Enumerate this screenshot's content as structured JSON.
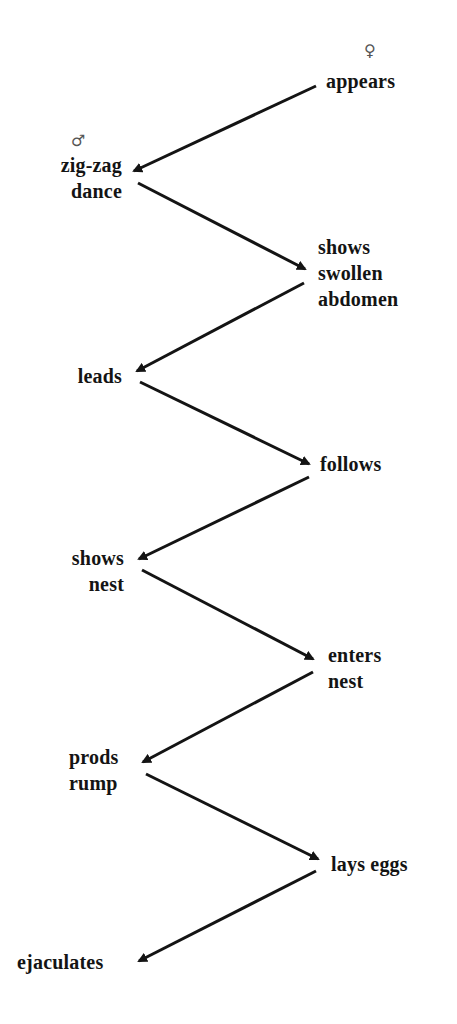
{
  "diagram": {
    "type": "courtship-sequence",
    "colors": {
      "background": "#ffffff",
      "ink": "#141414",
      "symbol": "#555555"
    },
    "symbols": {
      "female": "♀",
      "male": "♂"
    },
    "female_column": [
      {
        "id": "f1",
        "text": "appears"
      },
      {
        "id": "f2",
        "text": "shows\nswollen\nabdomen"
      },
      {
        "id": "f3",
        "text": "follows"
      },
      {
        "id": "f4",
        "text": "enters\nnest"
      },
      {
        "id": "f5",
        "text": "lays eggs"
      }
    ],
    "male_column": [
      {
        "id": "m1",
        "text": "zig-zag\ndance"
      },
      {
        "id": "m2",
        "text": "leads"
      },
      {
        "id": "m3",
        "text": "shows\nnest"
      },
      {
        "id": "m4",
        "text": "prods\nrump"
      },
      {
        "id": "m5",
        "text": "ejaculates"
      }
    ],
    "sequence": [
      {
        "from": "f1",
        "to": "m1"
      },
      {
        "from": "m1",
        "to": "f2"
      },
      {
        "from": "f2",
        "to": "m2"
      },
      {
        "from": "m2",
        "to": "f3"
      },
      {
        "from": "f3",
        "to": "m3"
      },
      {
        "from": "m3",
        "to": "f4"
      },
      {
        "from": "f4",
        "to": "m4"
      },
      {
        "from": "m4",
        "to": "f5"
      },
      {
        "from": "f5",
        "to": "m5"
      }
    ]
  }
}
